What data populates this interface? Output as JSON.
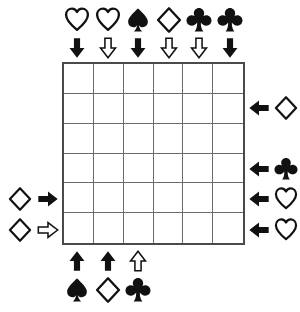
{
  "puzzle": {
    "title": "Suit Arrow Grid Puzzle",
    "grid": {
      "columns": 6,
      "rows": 6,
      "cell_size_px": 30.5,
      "border_color": "#4a4a4a",
      "line_color": "#6b6b6b",
      "cells": [
        [
          "",
          "",
          "",
          "",
          "",
          ""
        ],
        [
          "",
          "",
          "",
          "",
          "",
          ""
        ],
        [
          "",
          "",
          "",
          "",
          "",
          ""
        ],
        [
          "",
          "",
          "",
          "",
          "",
          ""
        ],
        [
          "",
          "",
          "",
          "",
          "",
          ""
        ],
        [
          "",
          "",
          "",
          "",
          "",
          ""
        ]
      ]
    },
    "colors": {
      "ink": "#111111",
      "paper": "#ffffff",
      "grid_border": "#4a4a4a",
      "grid_line": "#6b6b6b"
    },
    "clues": {
      "top": [
        {
          "column": 1,
          "suit": "heart",
          "suit_fill": "outline",
          "suit_icon": "heart-outline-icon",
          "arrow": "down",
          "arrow_fill": "filled",
          "arrow_icon": "arrow-down-filled-icon"
        },
        {
          "column": 2,
          "suit": "heart",
          "suit_fill": "outline",
          "suit_icon": "heart-outline-icon",
          "arrow": "down",
          "arrow_fill": "outline",
          "arrow_icon": "arrow-down-outline-icon"
        },
        {
          "column": 3,
          "suit": "spade",
          "suit_fill": "filled",
          "suit_icon": "spade-filled-icon",
          "arrow": "down",
          "arrow_fill": "filled",
          "arrow_icon": "arrow-down-filled-icon"
        },
        {
          "column": 4,
          "suit": "diamond",
          "suit_fill": "outline",
          "suit_icon": "diamond-outline-icon",
          "arrow": "down",
          "arrow_fill": "outline",
          "arrow_icon": "arrow-down-outline-icon"
        },
        {
          "column": 5,
          "suit": "club",
          "suit_fill": "filled",
          "suit_icon": "club-filled-icon",
          "arrow": "down",
          "arrow_fill": "outline",
          "arrow_icon": "arrow-down-outline-icon"
        },
        {
          "column": 6,
          "suit": "club",
          "suit_fill": "filled",
          "suit_icon": "club-filled-icon",
          "arrow": "down",
          "arrow_fill": "filled",
          "arrow_icon": "arrow-down-filled-icon"
        }
      ],
      "bottom": [
        {
          "column": 1,
          "suit": "spade",
          "suit_fill": "filled",
          "suit_icon": "spade-filled-icon",
          "arrow": "up",
          "arrow_fill": "filled",
          "arrow_icon": "arrow-up-filled-icon"
        },
        {
          "column": 2,
          "suit": "diamond",
          "suit_fill": "outline",
          "suit_icon": "diamond-outline-icon",
          "arrow": "up",
          "arrow_fill": "filled",
          "arrow_icon": "arrow-up-filled-icon"
        },
        {
          "column": 3,
          "suit": "club",
          "suit_fill": "filled",
          "suit_icon": "club-filled-icon",
          "arrow": "up",
          "arrow_fill": "outline",
          "arrow_icon": "arrow-up-outline-icon"
        }
      ],
      "left": [
        {
          "row": 5,
          "suit": "diamond",
          "suit_fill": "outline",
          "suit_icon": "diamond-outline-icon",
          "arrow": "right",
          "arrow_fill": "filled",
          "arrow_icon": "arrow-right-filled-icon"
        },
        {
          "row": 6,
          "suit": "diamond",
          "suit_fill": "outline",
          "suit_icon": "diamond-outline-icon",
          "arrow": "right",
          "arrow_fill": "outline",
          "arrow_icon": "arrow-right-outline-icon"
        }
      ],
      "right": [
        {
          "row": 2,
          "suit": "diamond",
          "suit_fill": "outline",
          "suit_icon": "diamond-outline-icon",
          "arrow": "left",
          "arrow_fill": "filled",
          "arrow_icon": "arrow-left-filled-icon"
        },
        {
          "row": 4,
          "suit": "club",
          "suit_fill": "filled",
          "suit_icon": "club-filled-icon",
          "arrow": "left",
          "arrow_fill": "filled",
          "arrow_icon": "arrow-left-filled-icon"
        },
        {
          "row": 5,
          "suit": "heart",
          "suit_fill": "outline",
          "suit_icon": "heart-outline-icon",
          "arrow": "left",
          "arrow_fill": "filled",
          "arrow_icon": "arrow-left-filled-icon"
        },
        {
          "row": 6,
          "suit": "heart",
          "suit_fill": "outline",
          "suit_icon": "heart-outline-icon",
          "arrow": "left",
          "arrow_fill": "filled",
          "arrow_icon": "arrow-left-filled-icon"
        }
      ]
    }
  }
}
